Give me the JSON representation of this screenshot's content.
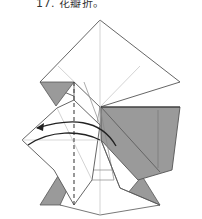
{
  "caption": {
    "text": "17. 花瓣折。"
  },
  "diagram": {
    "type": "origami-fold-diagram",
    "colors": {
      "paper_front": "#ffffff",
      "paper_back": "#9a9a9a",
      "edge": "#555555",
      "crease": "#b8b8b8",
      "arrow": "#222222",
      "fold_line": "#444444"
    },
    "symbols": [
      "valley-fold-dashed-line",
      "fold-over-arrow"
    ]
  }
}
